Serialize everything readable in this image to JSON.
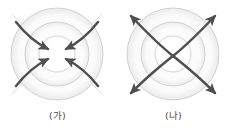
{
  "figure": {
    "background_color": "#ffffff",
    "panel_count": 2,
    "circle_stroke_color": "#c9c9c9",
    "circle_shadow_color": "#e6e6e6",
    "arrow_color": "#4f4f4f",
    "arrow_tail_color": "#cfcfcf"
  },
  "panels": [
    {
      "id": "panel-ga",
      "caption": "(가)",
      "arrow_direction": "inward",
      "arrow_count": 4,
      "circle_count": 3,
      "circle_radii": [
        46,
        32,
        18
      ],
      "center": {
        "cx": 57,
        "cy": 54
      },
      "arrows": [
        {
          "name": "arrow-from-top-left",
          "start_angle_deg": 225,
          "end_angle_deg": 225
        },
        {
          "name": "arrow-from-top-right",
          "start_angle_deg": 315,
          "end_angle_deg": 315
        },
        {
          "name": "arrow-from-bottom-right",
          "start_angle_deg": 45,
          "end_angle_deg": 45
        },
        {
          "name": "arrow-from-bottom-left",
          "start_angle_deg": 135,
          "end_angle_deg": 135
        }
      ]
    },
    {
      "id": "panel-na",
      "caption": "(나)",
      "arrow_direction": "outward",
      "arrow_count": 4,
      "circle_count": 3,
      "circle_radii": [
        46,
        32,
        18
      ],
      "center": {
        "cx": 57,
        "cy": 54
      },
      "arrows": [
        {
          "name": "arrow-to-top-left",
          "start_angle_deg": 225,
          "end_angle_deg": 225
        },
        {
          "name": "arrow-to-top-right",
          "start_angle_deg": 315,
          "end_angle_deg": 315
        },
        {
          "name": "arrow-to-bottom-right",
          "start_angle_deg": 45,
          "end_angle_deg": 45
        },
        {
          "name": "arrow-to-bottom-left",
          "start_angle_deg": 135,
          "end_angle_deg": 135
        }
      ]
    }
  ]
}
